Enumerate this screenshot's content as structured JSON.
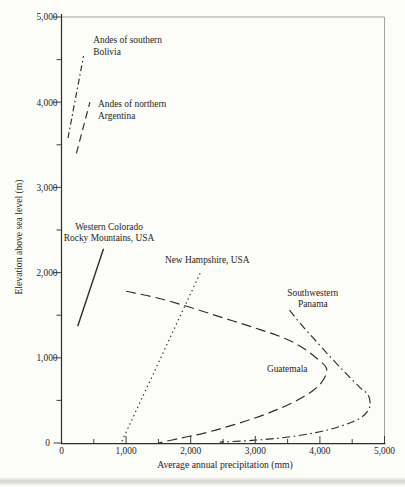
{
  "figure": {
    "background": "#fcfcf9",
    "ink_color": "#2d2d2d",
    "frame_color": "#a3a3a0",
    "text_color": "#262626",
    "page_edge_color": "#c6c6c2"
  },
  "chart_data": {
    "type": "line",
    "title": "",
    "xlabel": "Average annual precipitation (mm)",
    "ylabel": "Elevation above sea level (m)",
    "xlim": [
      0,
      5000
    ],
    "ylim": [
      0,
      5000
    ],
    "grid": false,
    "legend": "inline-annotations",
    "x_tick_values": [
      0,
      1000,
      2000,
      3000,
      4000,
      5000
    ],
    "x_tick_labels": [
      "0",
      "1,000",
      "2,000",
      "3,000",
      "4,000",
      "5,000"
    ],
    "y_tick_values": [
      0,
      1000,
      2000,
      3000,
      4000,
      5000
    ],
    "y_tick_labels": [
      "0",
      "1,000",
      "2,000",
      "3,000",
      "4,000",
      "5,000"
    ],
    "minor_tick_interval": 500,
    "series": [
      {
        "id": "andes-southern-bolivia",
        "name": "Andes of southern Bolivia",
        "label_lines": [
          "Andes of southern",
          "Bolivia"
        ],
        "label_x": 490,
        "label_y": 4690,
        "label_align": "left",
        "line_style": "dashdot-short",
        "points": [
          [
            100,
            3580
          ],
          [
            340,
            4540
          ]
        ]
      },
      {
        "id": "andes-northern-argentina",
        "name": "Andes of northern Argentina",
        "label_lines": [
          "Andes of northern",
          "Argentina"
        ],
        "label_x": 565,
        "label_y": 3940,
        "label_align": "left",
        "line_style": "dash",
        "points": [
          [
            230,
            3400
          ],
          [
            440,
            4000
          ]
        ]
      },
      {
        "id": "western-colorado-rocky-mountains",
        "name": "Western Colorado Rocky Mountains, USA",
        "label_lines": [
          "Western Colorado",
          "Rocky Mountains, USA"
        ],
        "label_x": 735,
        "label_y": 2500,
        "label_align": "center",
        "line_style": "solid",
        "points": [
          [
            250,
            1370
          ],
          [
            650,
            2280
          ]
        ]
      },
      {
        "id": "new-hampshire",
        "name": "New Hampshire, USA",
        "label_lines": [
          "New Hampshire, USA"
        ],
        "label_x": 1600,
        "label_y": 2110,
        "label_align": "left",
        "line_style": "dotted",
        "points": [
          [
            935,
            20
          ],
          [
            2150,
            2000
          ]
        ]
      },
      {
        "id": "guatemala",
        "name": "Guatemala",
        "label_lines": [
          "Guatemala"
        ],
        "label_x": 3180,
        "label_y": 835,
        "label_align": "left",
        "line_style": "longdash",
        "points": [
          [
            1000,
            1780
          ],
          [
            1500,
            1700
          ],
          [
            2000,
            1590
          ],
          [
            2500,
            1470
          ],
          [
            3000,
            1350
          ],
          [
            3450,
            1230
          ],
          [
            3750,
            1110
          ],
          [
            3970,
            980
          ],
          [
            4100,
            880
          ],
          [
            4060,
            750
          ],
          [
            3920,
            630
          ],
          [
            3670,
            510
          ],
          [
            3350,
            395
          ],
          [
            2980,
            290
          ],
          [
            2580,
            195
          ],
          [
            2180,
            110
          ],
          [
            1830,
            55
          ],
          [
            1500,
            0
          ]
        ]
      },
      {
        "id": "southwestern-panama",
        "name": "Southwestern Panama",
        "label_lines": [
          "Southwestern",
          "Panama"
        ],
        "label_x": 3890,
        "label_y": 1725,
        "label_align": "center",
        "line_style": "dashdot",
        "points": [
          [
            3530,
            1560
          ],
          [
            3700,
            1400
          ],
          [
            3900,
            1230
          ],
          [
            4150,
            1020
          ],
          [
            4400,
            820
          ],
          [
            4620,
            650
          ],
          [
            4750,
            560
          ],
          [
            4770,
            420
          ],
          [
            4640,
            300
          ],
          [
            4330,
            200
          ],
          [
            3950,
            125
          ],
          [
            3450,
            65
          ],
          [
            2950,
            30
          ],
          [
            2450,
            10
          ]
        ]
      }
    ]
  }
}
